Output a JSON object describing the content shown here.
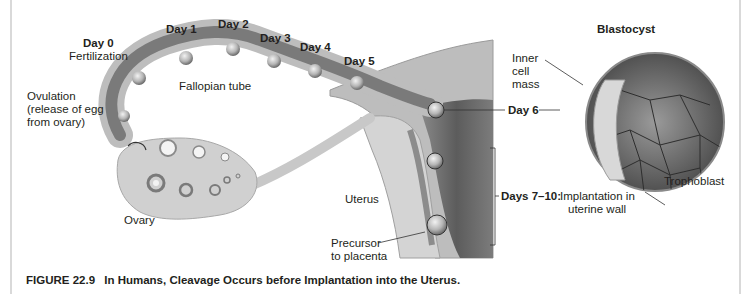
{
  "figure": {
    "number": "FIGURE 22.9",
    "title": "In Humans, Cleavage Occurs before Implantation into the Uterus."
  },
  "labels": {
    "day0": "Day 0",
    "fertilization": "Fertilization",
    "day1": "Day 1",
    "day2": "Day 2",
    "day3": "Day 3",
    "day4": "Day 4",
    "day5": "Day 5",
    "day6": "Day 6",
    "fallopian_tube": "Fallopian tube",
    "ovulation_line1": "Ovulation",
    "ovulation_line2": "(release of egg",
    "ovulation_line3": "from ovary)",
    "ovary": "Ovary",
    "uterus": "Uterus",
    "precursor_line1": "Precursor",
    "precursor_line2": "to placenta",
    "days_7_10": "Days 7–10:",
    "implantation_line1": "Implantation in",
    "implantation_line2": "uterine wall",
    "blastocyst": "Blastocyst",
    "inner_line1": "Inner",
    "inner_line2": "cell",
    "inner_line3": "mass",
    "trophoblast": "Trophoblast"
  },
  "colors": {
    "tissue_light": "#d6d6d6",
    "tissue_mid": "#a9a9a9",
    "tissue_dark": "#6e6e6e",
    "text": "#231f20"
  }
}
